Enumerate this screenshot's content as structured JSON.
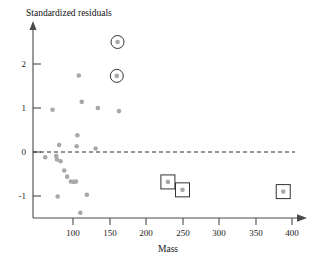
{
  "chart_data": {
    "type": "scatter",
    "title": "",
    "xlabel": "Mass",
    "ylabel": "Standardized residuals",
    "xlim": [
      45,
      415
    ],
    "ylim": [
      -1.75,
      2.85
    ],
    "xticks": [
      100,
      150,
      200,
      250,
      300,
      350,
      400
    ],
    "yticks": [
      -1,
      0,
      1,
      2
    ],
    "xtick_labels": [
      "100",
      "150",
      "200",
      "250",
      "300",
      "350",
      "400"
    ],
    "ytick_labels": [
      "-1",
      "0",
      "1",
      "2"
    ],
    "grid": false,
    "legend": null,
    "reference_lines": [
      {
        "name": "zero-residual-line",
        "orientation": "horizontal",
        "y": 0,
        "style": "dashed"
      }
    ],
    "series": [
      {
        "name": "standardized-residuals",
        "marker": "filled-circle",
        "color": "#a8a8a8",
        "points": [
          {
            "x": 62,
            "y": -0.12
          },
          {
            "x": 72,
            "y": 0.96
          },
          {
            "x": 77,
            "y": -0.09
          },
          {
            "x": 78,
            "y": -0.17
          },
          {
            "x": 79,
            "y": -1.01
          },
          {
            "x": 81,
            "y": 0.16
          },
          {
            "x": 83,
            "y": -0.21
          },
          {
            "x": 88,
            "y": -0.42
          },
          {
            "x": 92,
            "y": -0.56
          },
          {
            "x": 97,
            "y": -0.67
          },
          {
            "x": 101,
            "y": -0.68
          },
          {
            "x": 104,
            "y": -0.67
          },
          {
            "x": 105,
            "y": 0.13
          },
          {
            "x": 106,
            "y": 0.38
          },
          {
            "x": 108,
            "y": 1.74
          },
          {
            "x": 110,
            "y": -1.38
          },
          {
            "x": 112,
            "y": 1.14
          },
          {
            "x": 119,
            "y": -0.97
          },
          {
            "x": 131,
            "y": 0.08
          },
          {
            "x": 134,
            "y": 1.0
          },
          {
            "x": 163,
            "y": 0.93
          }
        ]
      },
      {
        "name": "circled-outliers",
        "marker": "filled-circle-with-ring",
        "color": "#a8a8a8",
        "annotation": "circle",
        "points": [
          {
            "x": 161,
            "y": 2.5
          },
          {
            "x": 160,
            "y": 1.73
          }
        ]
      },
      {
        "name": "boxed-influential-points",
        "marker": "filled-circle-with-box",
        "color": "#a8a8a8",
        "annotation": "square",
        "points": [
          {
            "x": 230,
            "y": -0.68
          },
          {
            "x": 250,
            "y": -0.86
          },
          {
            "x": 388,
            "y": -0.9
          }
        ]
      }
    ]
  },
  "labels": {
    "y_axis_title": "Standardized residuals",
    "x_axis_title": "Mass"
  }
}
